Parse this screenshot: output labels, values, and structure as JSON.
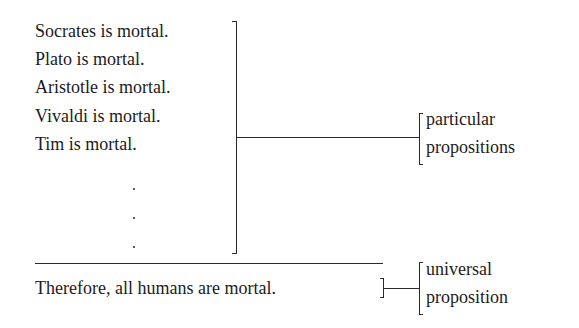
{
  "premises": [
    "Socrates is mortal.",
    "Plato is mortal.",
    "Aristotle is mortal.",
    "Vivaldi is mortal.",
    "Tim is mortal."
  ],
  "ellipsis": ".",
  "conclusion": "Therefore, all humans are mortal.",
  "labels": {
    "particular": [
      "particular",
      "propositions"
    ],
    "universal": [
      "universal",
      "proposition"
    ]
  }
}
